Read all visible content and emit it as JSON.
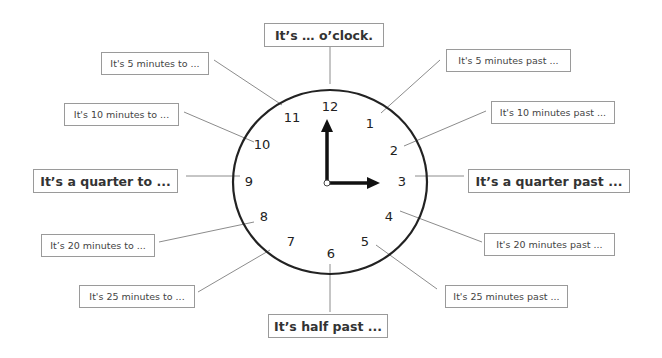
{
  "diagram": {
    "clock": {
      "numbers": [
        "12",
        "1",
        "2",
        "3",
        "4",
        "5",
        "6",
        "7",
        "8",
        "9",
        "10",
        "11"
      ],
      "hour_hand_points_to": "12",
      "minute_hand_points_to": "3"
    },
    "labels": {
      "oclock": "It’s … o’clock.",
      "five_past": "It's 5 minutes past ...",
      "ten_past": "It's 10 minutes past ...",
      "quarter_past": "It’s a quarter past ...",
      "twenty_past": "It's 20 minutes past ...",
      "twentyfive_past": "It's 25 minutes past ...",
      "half_past": "It’s half past ...",
      "twentyfive_to": "It's 25 minutes to ...",
      "twenty_to": "It’s 20 minutes to ...",
      "quarter_to": "It’s a quarter to ...",
      "ten_to": "It's 10 minutes to ...",
      "five_to": "It's 5 minutes to ..."
    }
  }
}
